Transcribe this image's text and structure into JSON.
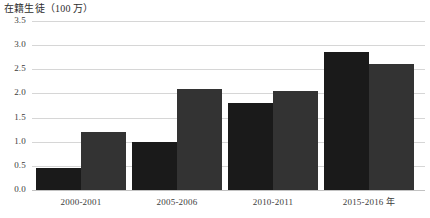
{
  "chart_data": {
    "type": "bar",
    "title": "在籍生徒（100 万）",
    "xlabel": "",
    "ylabel": "",
    "categories": [
      "2000-2001",
      "2005-2006",
      "2010-2011",
      "2015-2016 年"
    ],
    "series": [
      {
        "name": "series-1",
        "color": "#1a1a1a",
        "values": [
          0.45,
          1.0,
          1.8,
          2.85
        ]
      },
      {
        "name": "series-2",
        "color": "#333333",
        "values": [
          1.2,
          2.1,
          2.05,
          2.6
        ]
      }
    ],
    "ylim": [
      0.0,
      3.5
    ],
    "ytick_step": 0.5,
    "yticks": [
      "3.5",
      "3.0",
      "2.5",
      "2.0",
      "1.5",
      "1.0",
      "0.5",
      "0.0"
    ],
    "ytick_values": [
      3.5,
      3.0,
      2.5,
      2.0,
      1.5,
      1.0,
      0.5,
      0.0
    ],
    "grid": true,
    "grid_color": "#d6d6d6",
    "legend": "none",
    "background": "#ffffff"
  }
}
